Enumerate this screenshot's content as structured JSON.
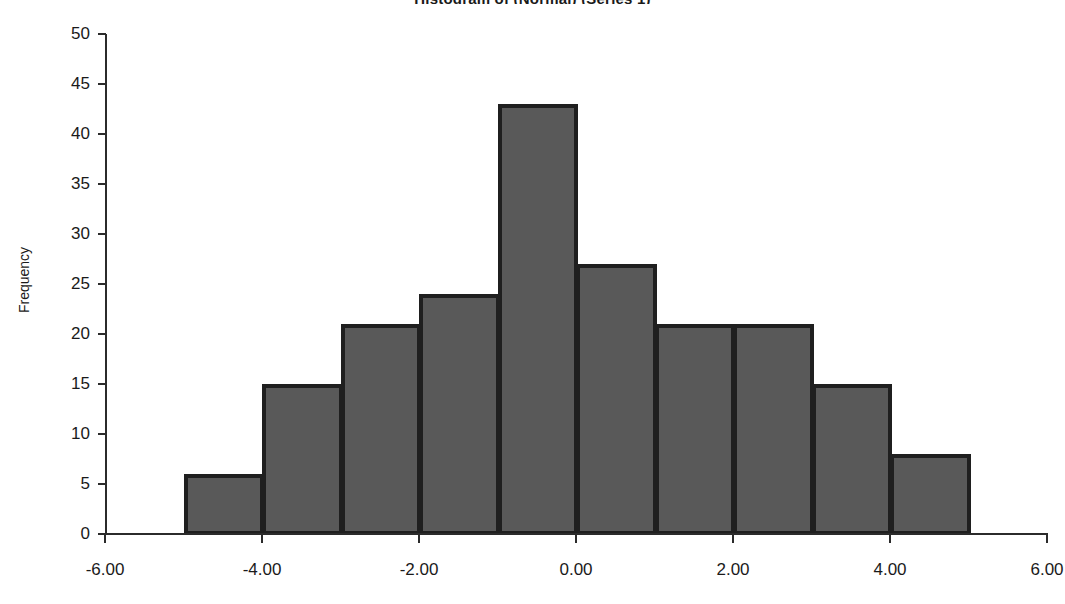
{
  "chart_data": {
    "type": "bar",
    "title": "Histogram of (Normal) (Series 1)",
    "xlabel": "",
    "ylabel": "Frequency",
    "grid": false,
    "legend": "none",
    "xlim": [
      -6.0,
      6.0
    ],
    "ylim": [
      0,
      50
    ],
    "x_ticks": [
      "-6.00",
      "-4.00",
      "-2.00",
      "0.00",
      "2.00",
      "4.00",
      "6.00"
    ],
    "x_tick_values": [
      -6,
      -4,
      -2,
      0,
      2,
      4,
      6
    ],
    "y_ticks": [
      "0",
      "5",
      "10",
      "15",
      "20",
      "25",
      "30",
      "35",
      "40",
      "45",
      "50"
    ],
    "y_tick_values": [
      0,
      5,
      10,
      15,
      20,
      25,
      30,
      35,
      40,
      45,
      50
    ],
    "bin_edges": [
      -5,
      -4,
      -3,
      -2,
      -1,
      0,
      1,
      2,
      3,
      4,
      5
    ],
    "categories": [
      "-5 to -4",
      "-4 to -3",
      "-3 to -2",
      "-2 to -1",
      "-1 to 0",
      "0 to 1",
      "1 to 2",
      "2 to 3",
      "3 to 4",
      "4 to 5"
    ],
    "values": [
      6,
      15,
      21,
      24,
      43,
      27,
      21,
      15,
      8,
      0
    ],
    "bars": [
      {
        "x0": -5,
        "x1": -4,
        "value": 6
      },
      {
        "x0": -4,
        "x1": -3,
        "value": 15
      },
      {
        "x0": -3,
        "x1": -2,
        "value": 21
      },
      {
        "x0": -2,
        "x1": -1,
        "value": 24
      },
      {
        "x0": -1,
        "x1": 0,
        "value": 43
      },
      {
        "x0": 0,
        "x1": 1,
        "value": 27
      },
      {
        "x0": 1,
        "x1": 2,
        "value": 21
      },
      {
        "x0": 2,
        "x1": 3,
        "value": 21
      },
      {
        "x0": 3,
        "x1": 4,
        "value": 15
      },
      {
        "x0": 4,
        "x1": 5,
        "value": 8
      }
    ],
    "colors": {
      "bar_fill": "#595959",
      "bar_border": "#1f1f1f",
      "axis": "#2b2b2b",
      "text": "#1a1a1a",
      "background": "#ffffff"
    }
  }
}
